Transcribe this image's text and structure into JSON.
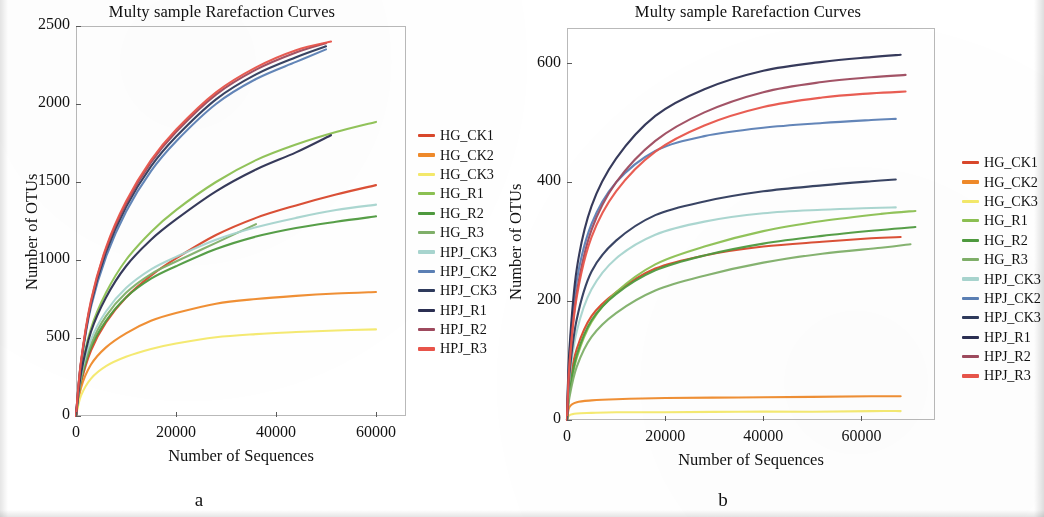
{
  "figure": {
    "panels": [
      {
        "id": "a",
        "label": "a",
        "title": "Multy sample Rarefaction Curves",
        "xlabel": "Number of Sequences",
        "ylabel": "Number of OTUs"
      },
      {
        "id": "b",
        "label": "b",
        "title": "Multy sample Rarefaction Curves",
        "xlabel": "Number of Sequences",
        "ylabel": "Number of OTUs"
      }
    ]
  },
  "legend_labels": [
    "HG_CK1",
    "HG_CK2",
    "HG_CK3",
    "HG_R1",
    "HG_R2",
    "HG_R3",
    "HPJ_CK3",
    "HPJ_CK2",
    "HPJ_CK3",
    "HPJ_R1",
    "HPJ_R2",
    "HPJ_R3"
  ],
  "series_colors": [
    "#d9472b",
    "#ef8a2a",
    "#f4e96a",
    "#8cc152",
    "#4e9a3e",
    "#7fb069",
    "#a8d5cf",
    "#5b7fb5",
    "#2e3a5c",
    "#2b2f52",
    "#9e4a5e",
    "#e8544a"
  ],
  "chart_data": [
    {
      "type": "line",
      "panel": "a",
      "title": "Multy sample Rarefaction Curves",
      "xlabel": "Number of Sequences",
      "ylabel": "Number of OTUs",
      "xlim": [
        0,
        66000
      ],
      "ylim": [
        0,
        2500
      ],
      "xticks": [
        0,
        20000,
        40000,
        60000
      ],
      "xtick_labels": [
        "0",
        "20000",
        "40000",
        "60000"
      ],
      "yticks": [
        0,
        500,
        1000,
        1500,
        2000,
        2500
      ],
      "ytick_labels": [
        "0",
        "500",
        "1000",
        "1500",
        "2000",
        "2500"
      ],
      "grid": false,
      "legend_position": "right",
      "series": [
        {
          "name": "HG_CK1",
          "color": "#d9472b",
          "x": [
            0,
            1000,
            3000,
            6000,
            10000,
            15000,
            20000,
            28000,
            36000,
            44000,
            52000,
            60000
          ],
          "y": [
            0,
            210,
            420,
            600,
            760,
            900,
            1010,
            1160,
            1270,
            1350,
            1420,
            1480
          ]
        },
        {
          "name": "HG_CK2",
          "color": "#ef8a2a",
          "x": [
            0,
            1000,
            3000,
            6000,
            10000,
            15000,
            20000,
            28000,
            36000,
            44000,
            52000,
            60000
          ],
          "y": [
            0,
            180,
            330,
            440,
            530,
            610,
            660,
            720,
            750,
            770,
            785,
            795
          ]
        },
        {
          "name": "HG_CK3",
          "color": "#f4e96a",
          "x": [
            0,
            1000,
            3000,
            6000,
            10000,
            15000,
            20000,
            28000,
            36000,
            44000,
            52000,
            60000
          ],
          "y": [
            0,
            130,
            240,
            320,
            380,
            430,
            465,
            505,
            525,
            538,
            548,
            555
          ]
        },
        {
          "name": "HG_R1",
          "color": "#8cc152",
          "x": [
            0,
            1000,
            3000,
            6000,
            10000,
            15000,
            20000,
            28000,
            36000,
            44000,
            52000,
            60000
          ],
          "y": [
            0,
            280,
            560,
            790,
            1000,
            1180,
            1320,
            1500,
            1640,
            1740,
            1820,
            1885
          ]
        },
        {
          "name": "HG_R2",
          "color": "#4e9a3e",
          "x": [
            0,
            1000,
            3000,
            6000,
            10000,
            15000,
            20000,
            28000,
            36000,
            44000,
            52000,
            60000
          ],
          "y": [
            0,
            230,
            440,
            610,
            760,
            880,
            960,
            1070,
            1150,
            1205,
            1245,
            1280
          ]
        },
        {
          "name": "HG_R3",
          "color": "#7fb069",
          "x": [
            0,
            1000,
            3000,
            6000,
            10000,
            15000,
            20000,
            28000,
            36000
          ],
          "y": [
            0,
            240,
            460,
            640,
            790,
            910,
            990,
            1110,
            1230
          ]
        },
        {
          "name": "HPJ_CK3",
          "color": "#a8d5cf",
          "x": [
            0,
            1000,
            3000,
            6000,
            10000,
            15000,
            20000,
            28000,
            36000,
            44000,
            52000,
            60000
          ],
          "y": [
            0,
            260,
            490,
            670,
            820,
            940,
            1020,
            1130,
            1210,
            1270,
            1320,
            1355
          ]
        },
        {
          "name": "HPJ_CK2",
          "color": "#5b7fb5",
          "x": [
            0,
            1000,
            3000,
            6000,
            10000,
            15000,
            20000,
            28000,
            36000,
            44000,
            50000
          ],
          "y": [
            0,
            330,
            700,
            1020,
            1310,
            1570,
            1760,
            2000,
            2160,
            2270,
            2350
          ]
        },
        {
          "name": "HPJ_CK3",
          "color": "#2e3a5c",
          "x": [
            0,
            1000,
            3000,
            6000,
            10000,
            15000,
            20000,
            28000,
            36000,
            44000,
            50000
          ],
          "y": [
            0,
            340,
            720,
            1050,
            1340,
            1600,
            1790,
            2030,
            2190,
            2300,
            2370
          ]
        },
        {
          "name": "HPJ_R1",
          "color": "#2b2f52",
          "x": [
            0,
            1000,
            3000,
            6000,
            10000,
            15000,
            20000,
            28000,
            36000,
            44000,
            51000
          ],
          "y": [
            0,
            270,
            540,
            760,
            960,
            1130,
            1260,
            1440,
            1580,
            1690,
            1800
          ]
        },
        {
          "name": "HPJ_R2",
          "color": "#9e4a5e",
          "x": [
            0,
            1000,
            3000,
            6000,
            10000,
            15000,
            20000,
            28000,
            36000,
            44000,
            50000
          ],
          "y": [
            0,
            345,
            730,
            1070,
            1360,
            1625,
            1820,
            2060,
            2220,
            2330,
            2390
          ]
        },
        {
          "name": "HPJ_R3",
          "color": "#e8544a",
          "x": [
            0,
            1000,
            3000,
            6000,
            10000,
            15000,
            20000,
            28000,
            36000,
            44000,
            51000
          ],
          "y": [
            0,
            350,
            740,
            1080,
            1375,
            1640,
            1835,
            2075,
            2235,
            2345,
            2400
          ]
        }
      ]
    },
    {
      "type": "line",
      "panel": "b",
      "title": "Multy sample Rarefaction Curves",
      "xlabel": "Number of Sequences",
      "ylabel": "Number of OTUs",
      "xlim": [
        0,
        75000
      ],
      "ylim": [
        0,
        660
      ],
      "xticks": [
        0,
        20000,
        40000,
        60000
      ],
      "xtick_labels": [
        "0",
        "20000",
        "40000",
        "60000"
      ],
      "yticks": [
        0,
        200,
        400,
        600
      ],
      "ytick_labels": [
        "0",
        "200",
        "400",
        "600"
      ],
      "grid": false,
      "legend_position": "right",
      "series": [
        {
          "name": "HG_CK1",
          "color": "#d9472b",
          "x": [
            0,
            500,
            2000,
            5000,
            10000,
            18000,
            28000,
            40000,
            52000,
            62000,
            68000
          ],
          "y": [
            0,
            60,
            120,
            175,
            215,
            255,
            277,
            292,
            300,
            306,
            308
          ]
        },
        {
          "name": "HG_CK2",
          "color": "#ef8a2a",
          "x": [
            0,
            500,
            2000,
            5000,
            10000,
            20000,
            35000,
            50000,
            62000,
            68000
          ],
          "y": [
            0,
            22,
            30,
            33,
            35,
            37,
            38,
            39,
            40,
            40
          ]
        },
        {
          "name": "HG_CK3",
          "color": "#f4e96a",
          "x": [
            0,
            500,
            2000,
            5000,
            10000,
            20000,
            35000,
            50000,
            62000,
            68000
          ],
          "y": [
            0,
            8,
            11,
            12,
            13,
            13,
            14,
            14,
            15,
            15
          ]
        },
        {
          "name": "HG_R1",
          "color": "#8cc152",
          "x": [
            0,
            500,
            2000,
            5000,
            10000,
            18000,
            28000,
            40000,
            52000,
            64000,
            71000
          ],
          "y": [
            0,
            45,
            105,
            165,
            215,
            262,
            292,
            318,
            335,
            347,
            352
          ]
        },
        {
          "name": "HG_R2",
          "color": "#4e9a3e",
          "x": [
            0,
            500,
            2000,
            5000,
            10000,
            18000,
            28000,
            40000,
            52000,
            64000,
            71000
          ],
          "y": [
            0,
            48,
            110,
            168,
            212,
            252,
            277,
            297,
            310,
            320,
            325
          ]
        },
        {
          "name": "HG_R3",
          "color": "#7fb069",
          "x": [
            0,
            500,
            2000,
            5000,
            10000,
            18000,
            28000,
            40000,
            52000,
            64000,
            70000
          ],
          "y": [
            0,
            38,
            90,
            140,
            180,
            218,
            243,
            265,
            280,
            290,
            296
          ]
        },
        {
          "name": "HPJ_CK3",
          "color": "#a8d5cf",
          "x": [
            0,
            500,
            2000,
            5000,
            10000,
            18000,
            28000,
            40000,
            52000,
            62000,
            67000
          ],
          "y": [
            0,
            70,
            150,
            220,
            272,
            312,
            334,
            348,
            354,
            357,
            358
          ]
        },
        {
          "name": "HPJ_CK2",
          "color": "#5b7fb5",
          "x": [
            0,
            500,
            2000,
            5000,
            10000,
            18000,
            28000,
            40000,
            52000,
            62000,
            67000
          ],
          "y": [
            0,
            110,
            235,
            330,
            400,
            453,
            478,
            492,
            500,
            505,
            507
          ]
        },
        {
          "name": "HPJ_CK3",
          "color": "#2e3a5c",
          "x": [
            0,
            500,
            2000,
            5000,
            10000,
            18000,
            28000,
            40000,
            52000,
            62000,
            67000
          ],
          "y": [
            0,
            78,
            170,
            250,
            302,
            345,
            368,
            385,
            395,
            402,
            405
          ]
        },
        {
          "name": "HPJ_R1",
          "color": "#2b2f52",
          "x": [
            0,
            500,
            2000,
            5000,
            10000,
            18000,
            28000,
            40000,
            52000,
            62000,
            68000
          ],
          "y": [
            0,
            120,
            255,
            360,
            440,
            512,
            557,
            588,
            603,
            611,
            615
          ]
        },
        {
          "name": "HPJ_R2",
          "color": "#9e4a5e",
          "x": [
            0,
            500,
            2000,
            5000,
            10000,
            18000,
            28000,
            40000,
            52000,
            62000,
            69000
          ],
          "y": [
            0,
            95,
            215,
            320,
            400,
            470,
            518,
            552,
            569,
            577,
            581
          ]
        },
        {
          "name": "HPJ_R3",
          "color": "#e8544a",
          "x": [
            0,
            500,
            2000,
            5000,
            10000,
            18000,
            28000,
            40000,
            52000,
            62000,
            69000
          ],
          "y": [
            0,
            92,
            208,
            308,
            385,
            452,
            496,
            527,
            543,
            550,
            553
          ]
        }
      ]
    }
  ]
}
